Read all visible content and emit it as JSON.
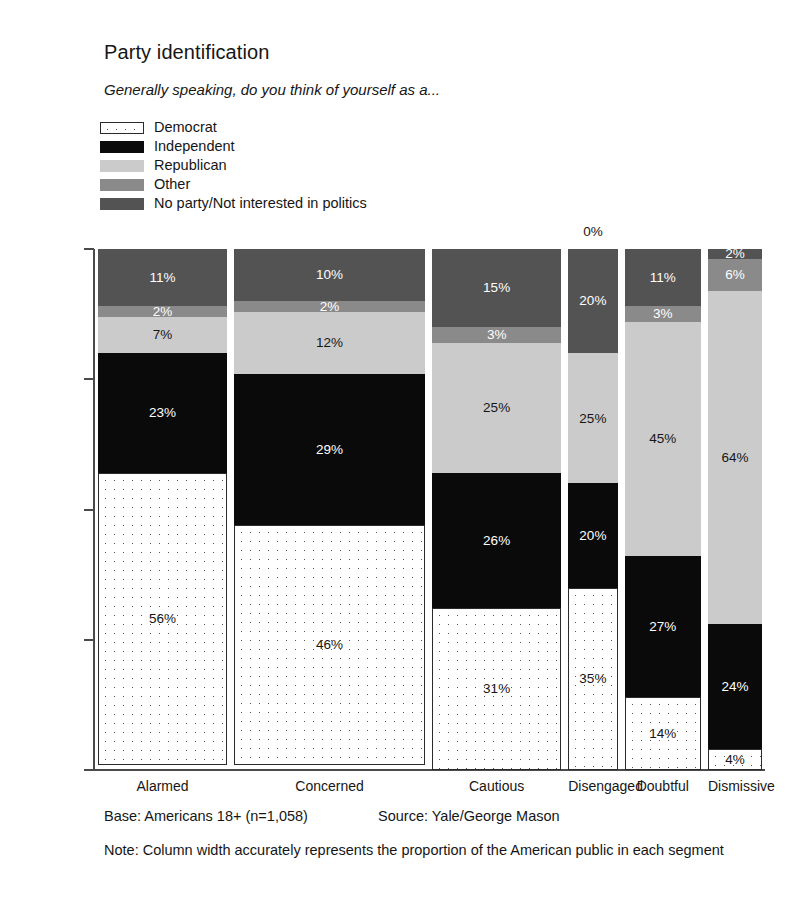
{
  "header": {
    "title": "Party identification",
    "subtitle": "Generally speaking, do you think of yourself as a..."
  },
  "legend": {
    "items": [
      {
        "label": "Democrat",
        "key": "democrat",
        "color": "#ffffff"
      },
      {
        "label": "Independent",
        "key": "independent",
        "color": "#0a0a0a"
      },
      {
        "label": "Republican",
        "key": "republican",
        "color": "#cbcbcb"
      },
      {
        "label": "Other",
        "key": "other",
        "color": "#8a8a8a"
      },
      {
        "label": "No party/Not interested in politics",
        "key": "noparty",
        "color": "#535353"
      }
    ]
  },
  "axis": {
    "y_top_label": "100%",
    "y_bottom_label": "0%",
    "ticks": [
      0,
      25,
      50,
      75,
      100
    ]
  },
  "footer": {
    "base": "Base: Americans 18+ (n=1,058)",
    "source": "Source: Yale/George Mason",
    "note": "Note: Column width accurately represents the proportion of the American public in each segment"
  },
  "chart_data": {
    "type": "bar",
    "stacked": true,
    "normalized_percent": true,
    "title": "Party identification",
    "subtitle": "Generally speaking, do you think of yourself as a...",
    "xlabel": "",
    "ylabel": "",
    "ylim": [
      0,
      100
    ],
    "grid": false,
    "legend_position": "top-left",
    "categories": [
      "Alarmed",
      "Concerned",
      "Cautious",
      "Disengaged",
      "Doubtful",
      "Dismissive"
    ],
    "category_widths_percent": [
      19.6,
      29.0,
      19.6,
      7.5,
      11.6,
      8.2
    ],
    "series": [
      {
        "name": "Democrat",
        "values": [
          56,
          46,
          31,
          35,
          14,
          4
        ]
      },
      {
        "name": "Independent",
        "values": [
          23,
          29,
          26,
          20,
          27,
          24
        ]
      },
      {
        "name": "Republican",
        "values": [
          7,
          12,
          25,
          25,
          45,
          64
        ]
      },
      {
        "name": "Other",
        "values": [
          2,
          2,
          3,
          0,
          3,
          6
        ]
      },
      {
        "name": "No party/Not interested in politics",
        "values": [
          11,
          10,
          15,
          20,
          11,
          2
        ]
      }
    ],
    "data_labels": {
      "Alarmed": {
        "Democrat": "56%",
        "Independent": "23%",
        "Republican": "7%",
        "Other": "2%",
        "No party/Not interested in politics": "11%"
      },
      "Concerned": {
        "Democrat": "46%",
        "Independent": "29%",
        "Republican": "12%",
        "Other": "2%",
        "No party/Not interested in politics": "10%"
      },
      "Cautious": {
        "Democrat": "31%",
        "Independent": "26%",
        "Republican": "25%",
        "Other": "3%",
        "No party/Not interested in politics": "15%"
      },
      "Disengaged": {
        "Democrat": "35%",
        "Independent": "20%",
        "Republican": "25%",
        "Other": "0%",
        "No party/Not interested in politics": "20%"
      },
      "Doubtful": {
        "Democrat": "14%",
        "Independent": "27%",
        "Republican": "45%",
        "Other": "3%",
        "No party/Not interested in politics": "11%"
      },
      "Dismissive": {
        "Democrat": "4%",
        "Independent": "24%",
        "Republican": "64%",
        "Other": "6%",
        "No party/Not interested in politics": "2%"
      }
    },
    "annotations": [
      {
        "text": "0%",
        "for_category": "Disengaged",
        "for_series": "Other",
        "placement": "above-bar"
      }
    ]
  }
}
